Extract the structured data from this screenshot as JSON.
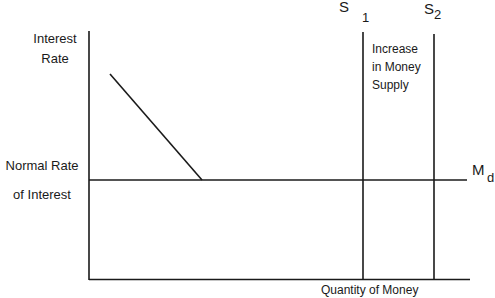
{
  "diagram": {
    "y_axis_label": [
      "Interest",
      "Rate"
    ],
    "x_axis_label": "Quantity of Money",
    "normal_rate_label": [
      "Normal Rate",
      "of Interest"
    ],
    "demand_curve": {
      "label": "M",
      "subscript": "d"
    },
    "supply_1": {
      "label": "S",
      "subscript": "1"
    },
    "supply_2": {
      "label": "S",
      "subscript": "2"
    },
    "annotation": [
      "Increase",
      "in Money",
      "Supply"
    ],
    "line_color": "#1a1a1a"
  }
}
